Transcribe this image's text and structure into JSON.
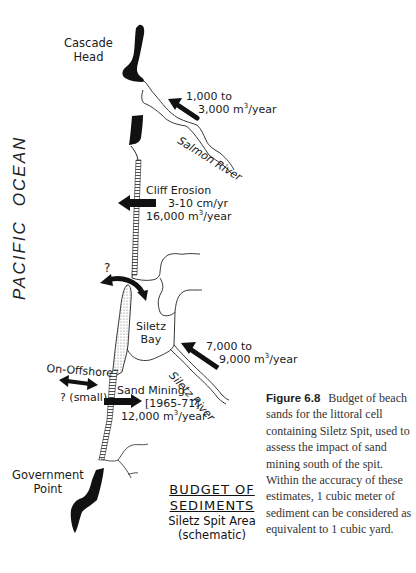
{
  "diagram": {
    "title": "BUDGET OF SEDIMENTS",
    "title_lines": [
      "BUDGET OF",
      "SEDIMENTS"
    ],
    "subtitle_lines": [
      "Siletz Spit Area",
      "(schematic)"
    ],
    "ocean_label": [
      "PACIFIC",
      "OCEAN"
    ],
    "places": {
      "cascade_head": [
        "Cascade",
        "Head"
      ],
      "salmon_river": "Salmon River",
      "siletz_bay": [
        "Siletz",
        "Bay"
      ],
      "siletz_river": "Siletz River",
      "government_point": [
        "Government",
        "Point"
      ]
    },
    "flows": {
      "salmon_river": {
        "line1": "1,000 to",
        "line2": "3,000 m",
        "sup": "3",
        "unit": "/year",
        "direction": "onshore"
      },
      "cliff_erosion": {
        "line1": "Cliff Erosion",
        "line2": "3-10 cm/yr",
        "line3": "16,000 m",
        "sup": "3",
        "unit": "/year",
        "direction": "offshore"
      },
      "bay_exchange": {
        "label": "?",
        "direction": "two-way"
      },
      "siletz_river": {
        "line1": "7,000 to",
        "line2": "9,000 m",
        "sup": "3",
        "unit": "/year",
        "direction": "onshore"
      },
      "on_offshore": {
        "line1": "On-Offshore",
        "line2": "? (small)",
        "direction": "two-way"
      },
      "sand_mining": {
        "line1": "Sand Mining",
        "line2": "[1965-71]",
        "line3": "12,000 m",
        "sup": "3",
        "unit": "/year",
        "direction": "removal"
      }
    }
  },
  "caption": {
    "figure_label": "Figure 6.8",
    "text": "Budget of beach sands for the littoral cell containing Siletz Spit, used to assess the impact of sand mining south of the spit. Within the accuracy of these estimates, 1 cubic meter of sediment can be considered as equivalent to 1 cubic yard."
  },
  "colors": {
    "ink": "#111111",
    "spit_fill": "#d8d8d8",
    "background": "#ffffff",
    "caption_text": "#333333"
  }
}
